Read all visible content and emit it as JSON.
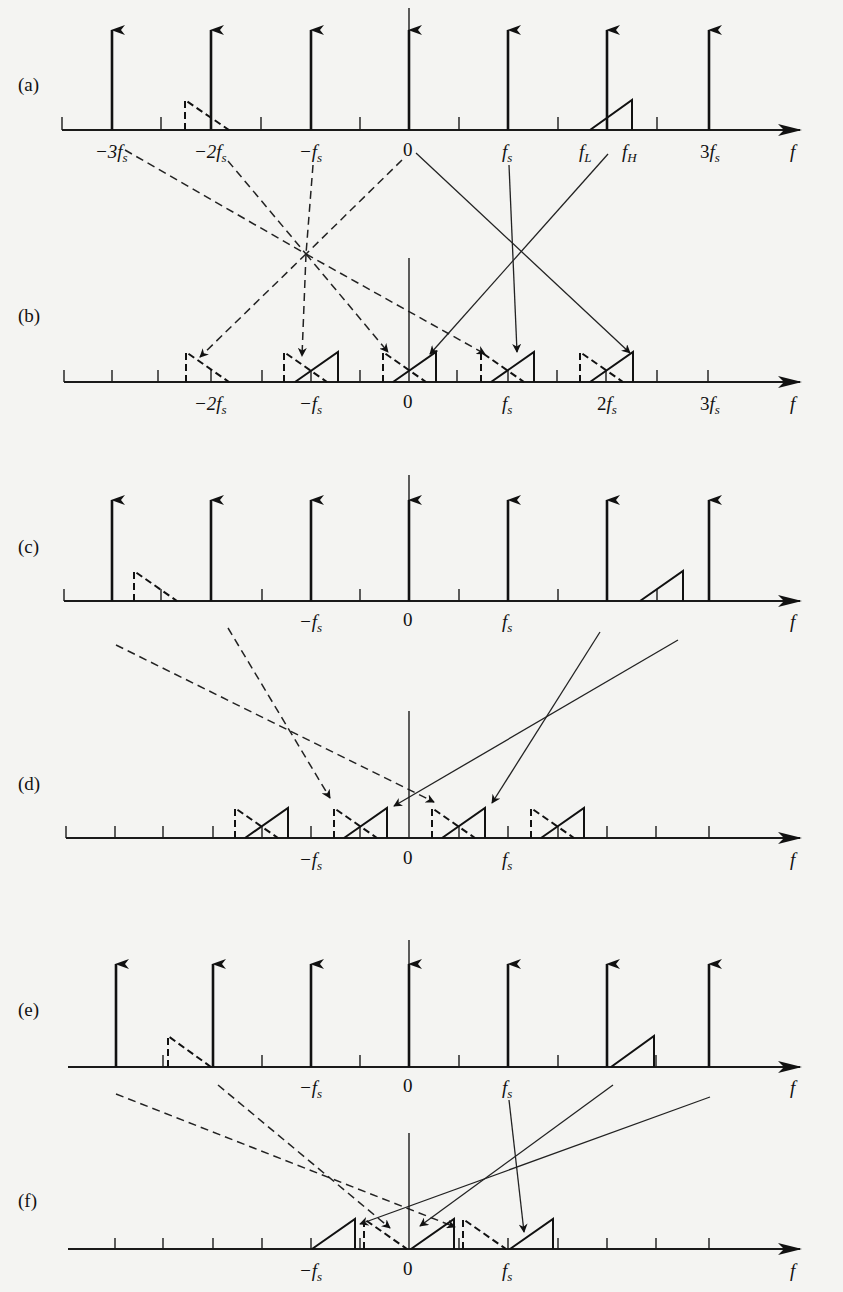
{
  "figure": {
    "panels": [
      {
        "id": "a",
        "label": "(a)",
        "tick_labels": [
          "−3f_s",
          "−2f_s",
          "−f_s",
          "0",
          "f_s",
          "f_L",
          "f_H",
          "3f_s"
        ],
        "axis_label": "f"
      },
      {
        "id": "b",
        "label": "(b)",
        "tick_labels": [
          "−2f_s",
          "−f_s",
          "0",
          "f_s",
          "2f_s",
          "3f_s"
        ],
        "axis_label": "f"
      },
      {
        "id": "c",
        "label": "(c)",
        "tick_labels": [
          "−f_s",
          "0",
          "f_s"
        ],
        "axis_label": "f"
      },
      {
        "id": "d",
        "label": "(d)",
        "tick_labels": [
          "−f_s",
          "0",
          "f_s"
        ],
        "axis_label": "f"
      },
      {
        "id": "e",
        "label": "(e)",
        "tick_labels": [
          "−f_s",
          "0",
          "f_s"
        ],
        "axis_label": "f"
      },
      {
        "id": "f",
        "label": "(f)",
        "tick_labels": [
          "−f_s",
          "0",
          "f_s"
        ],
        "axis_label": "f"
      }
    ]
  },
  "labels": {
    "a": "(a)",
    "b": "(b)",
    "c": "(c)",
    "d": "(d)",
    "e": "(e)",
    "f": "f"
  },
  "text": {
    "panel_a": "(a)",
    "panel_b": "(b)",
    "panel_c": "(c)",
    "panel_d": "(d)",
    "panel_e": "(e)",
    "panel_f": "(f)",
    "axis_f": "f",
    "zero": "0",
    "neg3fs_coef": "−3",
    "neg2fs_coef": "−2",
    "negfs_coef": "−",
    "two": "2",
    "three": "3",
    "f_main": "f",
    "s_sub": "s",
    "L_sub": "L",
    "H_sub": "H"
  }
}
